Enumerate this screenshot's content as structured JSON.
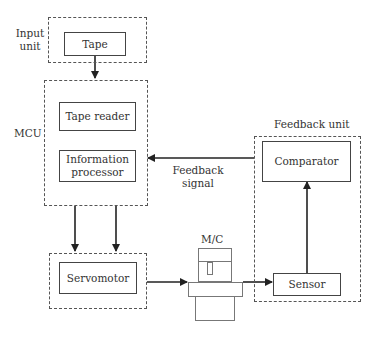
{
  "diagram": {
    "input_unit": {
      "label_line1": "Input",
      "label_line2": "unit",
      "tape": "Tape"
    },
    "mcu": {
      "label": "MCU",
      "tape_reader": "Tape reader",
      "info_line1": "Information",
      "info_line2": "processor"
    },
    "feedback_signal": {
      "line1": "Feedback",
      "line2": "signal"
    },
    "feedback_unit": {
      "label": "Feedback unit",
      "comparator": "Comparator",
      "sensor": "Sensor"
    },
    "servomotor": "Servomotor",
    "machine": {
      "label": "M/C"
    },
    "connections": [
      {
        "from": "Tape",
        "to": "MCU"
      },
      {
        "from": "MCU",
        "to": "Servomotor",
        "count": 2
      },
      {
        "from": "Servomotor",
        "to": "M/C"
      },
      {
        "from": "M/C",
        "to": "Sensor"
      },
      {
        "from": "Sensor",
        "to": "Comparator"
      },
      {
        "from": "Comparator",
        "to": "MCU",
        "label": "Feedback signal"
      }
    ]
  }
}
